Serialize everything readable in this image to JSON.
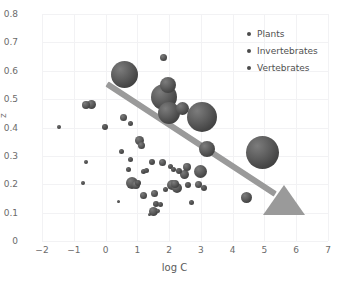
{
  "chart_data": {
    "type": "scatter",
    "title": "",
    "xlabel": "log C",
    "ylabel": "z",
    "xlim": [
      -2,
      7
    ],
    "ylim": [
      0,
      0.8
    ],
    "xticks": [
      "-2",
      "-1",
      "0",
      "1",
      "2",
      "3",
      "4",
      "5",
      "6",
      "7"
    ],
    "yticks": [
      "0",
      "0.1",
      "0.2",
      "0.3",
      "0.4",
      "0.5",
      "0.6",
      "0.7",
      "0.8"
    ],
    "grid": true,
    "legend_position": "top-right",
    "legend": [
      {
        "label": "Plants",
        "color": "#4b4b4b"
      },
      {
        "label": "Invertebrates",
        "color": "#4b4b4b"
      },
      {
        "label": "Vertebrates",
        "color": "#4b4b4b"
      }
    ],
    "marker_style": "3d-sphere",
    "marker_color": "#5a5a5a",
    "annotations": [
      {
        "type": "trend-arrow",
        "color": "#9a9a9a",
        "from": {
          "x": 0.05,
          "y": 0.553
        },
        "to": {
          "x": 5.35,
          "y": 0.165
        },
        "meaning": "negative trend of z with log C"
      }
    ],
    "points": [
      {
        "x": -1.48,
        "y": 0.402,
        "size": 4
      },
      {
        "x": -0.72,
        "y": 0.206,
        "size": 4
      },
      {
        "x": -0.62,
        "y": 0.279,
        "size": 4
      },
      {
        "x": -0.62,
        "y": 0.478,
        "size": 8
      },
      {
        "x": -0.45,
        "y": 0.481,
        "size": 9
      },
      {
        "x": -0.03,
        "y": 0.402,
        "size": 6
      },
      {
        "x": 0.42,
        "y": 0.139,
        "size": 3
      },
      {
        "x": 0.5,
        "y": 0.316,
        "size": 5
      },
      {
        "x": 0.55,
        "y": 0.437,
        "size": 7
      },
      {
        "x": 0.6,
        "y": 0.588,
        "size": 27
      },
      {
        "x": 0.72,
        "y": 0.252,
        "size": 5
      },
      {
        "x": 0.78,
        "y": 0.413,
        "size": 5
      },
      {
        "x": 0.8,
        "y": 0.286,
        "size": 5
      },
      {
        "x": 0.82,
        "y": 0.205,
        "size": 12
      },
      {
        "x": 0.95,
        "y": 0.198,
        "size": 8
      },
      {
        "x": 1.02,
        "y": 0.206,
        "size": 6
      },
      {
        "x": 1.08,
        "y": 0.353,
        "size": 9
      },
      {
        "x": 1.12,
        "y": 0.336,
        "size": 7
      },
      {
        "x": 1.18,
        "y": 0.245,
        "size": 5
      },
      {
        "x": 1.2,
        "y": 0.162,
        "size": 7
      },
      {
        "x": 1.3,
        "y": 0.248,
        "size": 5
      },
      {
        "x": 1.38,
        "y": 0.093,
        "size": 3
      },
      {
        "x": 1.45,
        "y": 0.28,
        "size": 6
      },
      {
        "x": 1.52,
        "y": 0.105,
        "size": 9
      },
      {
        "x": 1.55,
        "y": 0.168,
        "size": 7
      },
      {
        "x": 1.6,
        "y": 0.132,
        "size": 6
      },
      {
        "x": 1.66,
        "y": 0.104,
        "size": 4
      },
      {
        "x": 1.72,
        "y": 0.129,
        "size": 5
      },
      {
        "x": 1.78,
        "y": 0.277,
        "size": 7
      },
      {
        "x": 1.82,
        "y": 0.645,
        "size": 7
      },
      {
        "x": 1.85,
        "y": 0.506,
        "size": 26
      },
      {
        "x": 1.88,
        "y": 0.183,
        "size": 5
      },
      {
        "x": 1.95,
        "y": 0.549,
        "size": 16
      },
      {
        "x": 2.0,
        "y": 0.452,
        "size": 22
      },
      {
        "x": 2.05,
        "y": 0.262,
        "size": 5
      },
      {
        "x": 2.08,
        "y": 0.199,
        "size": 10
      },
      {
        "x": 2.15,
        "y": 0.253,
        "size": 5
      },
      {
        "x": 2.2,
        "y": 0.202,
        "size": 8
      },
      {
        "x": 2.25,
        "y": 0.186,
        "size": 10
      },
      {
        "x": 2.3,
        "y": 0.245,
        "size": 6
      },
      {
        "x": 2.42,
        "y": 0.468,
        "size": 13
      },
      {
        "x": 2.48,
        "y": 0.233,
        "size": 9
      },
      {
        "x": 2.56,
        "y": 0.262,
        "size": 8
      },
      {
        "x": 2.6,
        "y": 0.196,
        "size": 6
      },
      {
        "x": 2.72,
        "y": 0.134,
        "size": 5
      },
      {
        "x": 2.92,
        "y": 0.198,
        "size": 7
      },
      {
        "x": 3.0,
        "y": 0.246,
        "size": 13
      },
      {
        "x": 3.05,
        "y": 0.437,
        "size": 30
      },
      {
        "x": 3.1,
        "y": 0.186,
        "size": 6
      },
      {
        "x": 3.2,
        "y": 0.324,
        "size": 16
      },
      {
        "x": 4.42,
        "y": 0.152,
        "size": 11
      },
      {
        "x": 4.95,
        "y": 0.311,
        "size": 33
      }
    ]
  }
}
